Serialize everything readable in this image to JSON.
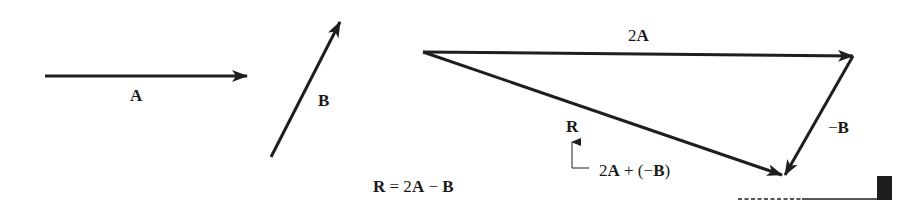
{
  "diagram": {
    "vectors": {
      "A": {
        "label": "A",
        "from": [
          45,
          76
        ],
        "to": [
          247,
          76
        ]
      },
      "B": {
        "label": "B",
        "from": [
          271,
          157
        ],
        "to": [
          340,
          22
        ]
      },
      "twoA": {
        "label_num": "2",
        "label_vec": "A",
        "from": [
          423,
          52
        ],
        "to": [
          853,
          56
        ]
      },
      "negB": {
        "label_sign": "−",
        "label_vec": "B",
        "from": [
          853,
          56
        ],
        "to": [
          785,
          175
        ]
      },
      "R": {
        "label": "R",
        "from": [
          423,
          52
        ],
        "to": [
          782,
          175
        ]
      }
    },
    "annotation": {
      "R_label": "R",
      "sum_parts": [
        "2",
        "A",
        " + (−",
        "B",
        ")"
      ]
    },
    "equation": {
      "lhs": "R",
      "eq": " = 2",
      "a": "A",
      "minus": " − ",
      "b": "B"
    },
    "colors": {
      "ink": "#1e1e1e",
      "background": "#ffffff"
    }
  }
}
